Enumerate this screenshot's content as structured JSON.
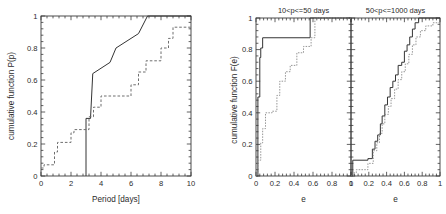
{
  "figure": {
    "background": "#ffffff",
    "ink": "#343434",
    "secondary_ink": "#8a8a8a"
  },
  "chart_data": [
    {
      "type": "line",
      "id": "period-cdf",
      "title": "",
      "xlabel": "Period [days]",
      "ylabel": "cumulative function P(p)",
      "xlim": [
        0,
        10
      ],
      "ylim": [
        0,
        1
      ],
      "xticks": [
        0,
        2,
        4,
        6,
        8,
        10
      ],
      "xticklabels": [
        "0",
        "2",
        "4",
        "6",
        "8",
        "10"
      ],
      "yticks": [
        0,
        0.2,
        0.4,
        0.6,
        0.8,
        1
      ],
      "yticklabels": [
        "0",
        "0.2",
        "0.4",
        "0.6",
        "0.8",
        "1"
      ],
      "grid": false,
      "legend": "none",
      "drawstyle": "steps-post",
      "series": [
        {
          "name": "solid",
          "style": "solid",
          "color": "#343434",
          "x": [
            3.0,
            3.0,
            3.3,
            3.45,
            3.45,
            4.6,
            4.6,
            5.0,
            5.0,
            6.5,
            6.5,
            7.1,
            7.1,
            10.0
          ],
          "y": [
            0.0,
            0.36,
            0.36,
            0.64,
            0.64,
            0.71,
            0.71,
            0.8,
            0.8,
            0.89,
            0.89,
            1.0,
            1.0,
            1.0
          ]
        },
        {
          "name": "dashed",
          "style": "dashed",
          "color": "#6e6e6e",
          "x": [
            0.0,
            0.2,
            0.2,
            0.9,
            0.9,
            1.1,
            1.1,
            2.0,
            2.0,
            2.2,
            2.2,
            3.2,
            3.2,
            3.5,
            3.5,
            4.0,
            4.0,
            6.0,
            6.0,
            6.5,
            6.5,
            7.0,
            7.0,
            8.0,
            8.0,
            8.5,
            8.5,
            8.8,
            8.8,
            10.0
          ],
          "y": [
            0.05,
            0.05,
            0.07,
            0.07,
            0.15,
            0.15,
            0.21,
            0.21,
            0.27,
            0.27,
            0.29,
            0.29,
            0.37,
            0.37,
            0.43,
            0.43,
            0.5,
            0.5,
            0.57,
            0.57,
            0.65,
            0.65,
            0.72,
            0.72,
            0.8,
            0.8,
            0.86,
            0.86,
            0.93,
            0.93
          ]
        }
      ]
    },
    {
      "type": "line",
      "id": "ecc-cdf-short",
      "title": "10<p<=50 days",
      "xlabel": "e",
      "ylabel": "cumulative function F(e)",
      "xlim": [
        0,
        1
      ],
      "ylim": [
        0,
        1
      ],
      "xticks": [
        0,
        0.2,
        0.4,
        0.6,
        0.8,
        1
      ],
      "xticklabels": [
        "0",
        "0.2",
        "0.4",
        "0.6",
        "0.8",
        "1"
      ],
      "yticks": [
        0,
        0.2,
        0.4,
        0.6,
        0.8,
        1
      ],
      "yticklabels": [
        "0",
        "0.2",
        "0.4",
        "0.6",
        "0.8",
        "1"
      ],
      "grid": false,
      "legend": "none",
      "drawstyle": "steps-post",
      "series": [
        {
          "name": "solid",
          "style": "solid",
          "color": "#343434",
          "x": [
            0.0,
            0.02,
            0.02,
            0.04,
            0.04,
            0.05,
            0.05,
            0.07,
            0.07,
            0.57,
            0.57,
            1.0
          ],
          "y": [
            0.0,
            0.0,
            0.5,
            0.5,
            0.75,
            0.75,
            0.81,
            0.81,
            0.875,
            0.875,
            1.0,
            1.0
          ]
        },
        {
          "name": "dotted",
          "style": "dotted",
          "color": "#8a8a8a",
          "x": [
            0.0,
            0.02,
            0.02,
            0.05,
            0.05,
            0.07,
            0.07,
            0.1,
            0.1,
            0.17,
            0.17,
            0.22,
            0.22,
            0.25,
            0.25,
            0.31,
            0.31,
            0.36,
            0.36,
            0.43,
            0.43,
            0.5,
            0.5,
            0.58,
            0.58,
            0.62,
            0.62,
            1.0
          ],
          "y": [
            0.0,
            0.0,
            0.1,
            0.1,
            0.21,
            0.21,
            0.3,
            0.3,
            0.4,
            0.4,
            0.41,
            0.41,
            0.51,
            0.51,
            0.6,
            0.6,
            0.66,
            0.66,
            0.7,
            0.7,
            0.78,
            0.78,
            0.82,
            0.82,
            0.875,
            0.875,
            1.0,
            1.0
          ]
        }
      ]
    },
    {
      "type": "line",
      "id": "ecc-cdf-long",
      "title": "50<p<=1000 days",
      "xlabel": "e",
      "ylabel": "",
      "xlim": [
        0,
        1
      ],
      "ylim": [
        0,
        1
      ],
      "xticks": [
        0,
        0.2,
        0.4,
        0.6,
        0.8,
        1
      ],
      "xticklabels": [
        "0",
        "0.2",
        "0.4",
        "0.6",
        "0.8",
        "1"
      ],
      "yticks": [
        0,
        0.2,
        0.4,
        0.6,
        0.8,
        1
      ],
      "yticklabels": [
        "0",
        "0.2",
        "0.4",
        "0.6",
        "0.8",
        "1"
      ],
      "grid": false,
      "legend": "none",
      "drawstyle": "steps-post",
      "series": [
        {
          "name": "solid",
          "style": "solid",
          "color": "#343434",
          "x": [
            0.0,
            0.02,
            0.02,
            0.19,
            0.19,
            0.24,
            0.24,
            0.27,
            0.27,
            0.3,
            0.3,
            0.33,
            0.33,
            0.35,
            0.35,
            0.38,
            0.38,
            0.41,
            0.41,
            0.44,
            0.44,
            0.47,
            0.47,
            0.5,
            0.5,
            0.53,
            0.53,
            0.57,
            0.57,
            0.6,
            0.6,
            0.63,
            0.63,
            0.66,
            0.66,
            0.69,
            0.69,
            0.72,
            0.72,
            0.76,
            0.76,
            1.0
          ],
          "y": [
            0.0,
            0.0,
            0.1,
            0.1,
            0.11,
            0.11,
            0.17,
            0.17,
            0.22,
            0.22,
            0.26,
            0.26,
            0.33,
            0.33,
            0.38,
            0.38,
            0.45,
            0.45,
            0.5,
            0.5,
            0.56,
            0.56,
            0.6,
            0.6,
            0.64,
            0.64,
            0.7,
            0.7,
            0.72,
            0.72,
            0.79,
            0.79,
            0.83,
            0.83,
            0.88,
            0.88,
            0.93,
            0.93,
            0.97,
            0.97,
            1.0,
            1.0
          ]
        },
        {
          "name": "dotted",
          "style": "dotted",
          "color": "#8a8a8a",
          "x": [
            0.0,
            0.03,
            0.03,
            0.06,
            0.06,
            0.19,
            0.19,
            0.25,
            0.25,
            0.29,
            0.29,
            0.32,
            0.32,
            0.35,
            0.35,
            0.38,
            0.38,
            0.42,
            0.42,
            0.45,
            0.45,
            0.49,
            0.49,
            0.53,
            0.53,
            0.57,
            0.57,
            0.61,
            0.61,
            0.65,
            0.65,
            0.69,
            0.69,
            0.73,
            0.73,
            0.78,
            0.78,
            0.84,
            0.84,
            0.92,
            0.92,
            1.0
          ],
          "y": [
            0.0,
            0.0,
            0.02,
            0.02,
            0.04,
            0.04,
            0.08,
            0.08,
            0.16,
            0.16,
            0.21,
            0.21,
            0.27,
            0.27,
            0.33,
            0.33,
            0.39,
            0.39,
            0.44,
            0.44,
            0.49,
            0.49,
            0.55,
            0.55,
            0.61,
            0.61,
            0.66,
            0.66,
            0.71,
            0.71,
            0.77,
            0.77,
            0.83,
            0.83,
            0.88,
            0.88,
            0.92,
            0.92,
            0.95,
            0.95,
            0.97,
            0.97
          ]
        }
      ]
    }
  ]
}
